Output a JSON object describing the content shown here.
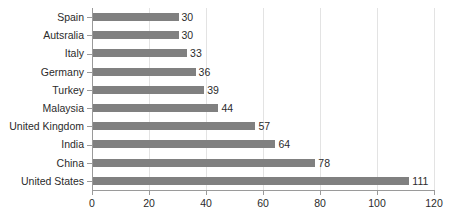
{
  "chart_data": {
    "type": "bar",
    "orientation": "horizontal",
    "title": "",
    "subtitle": "",
    "xlabel": "",
    "ylabel": "",
    "categories": [
      "Spain",
      "Autsralia",
      "Italy",
      "Germany",
      "Turkey",
      "Malaysia",
      "United Kingdom",
      "India",
      "China",
      "United States"
    ],
    "values": [
      30,
      30,
      33,
      36,
      39,
      44,
      57,
      64,
      78,
      111
    ],
    "data_labels": [
      "30",
      "30",
      "33",
      "36",
      "39",
      "44",
      "57",
      "64",
      "78",
      "111"
    ],
    "xlim": [
      0,
      120
    ],
    "xticks": [
      0,
      20,
      40,
      60,
      80,
      100,
      120
    ],
    "xtick_labels": [
      "0",
      "20",
      "40",
      "60",
      "80",
      "100",
      "120"
    ],
    "grid": "vertical",
    "legend": "none",
    "bar_color": "#808080",
    "gridline_color": "#e3e3e3",
    "axis_color": "#9a9a9a",
    "text_color": "#2b2b2b",
    "background_color": "#ffffff"
  }
}
